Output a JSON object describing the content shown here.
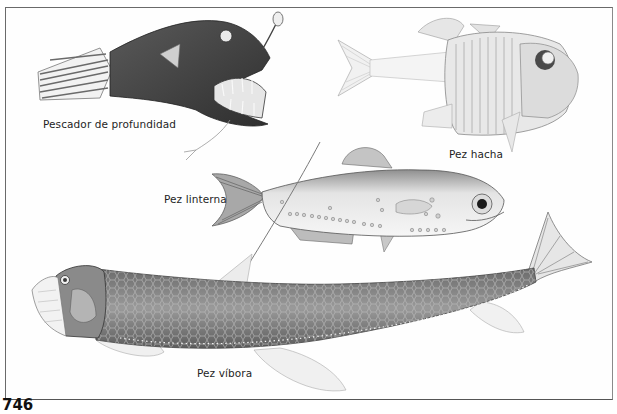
{
  "page": {
    "number": "746",
    "background": "#ffffff",
    "frame_color": "#6a6a6a"
  },
  "illustrations": [
    {
      "id": "anglerfish",
      "label": "Pescador de profundidad",
      "tone": "#4a4a4a"
    },
    {
      "id": "hatchetfish",
      "label": "Pez hacha",
      "tone": "#bdbdbd"
    },
    {
      "id": "lanternfish",
      "label": "Pez linterna",
      "tone": "#9a9a9a"
    },
    {
      "id": "viperfish",
      "label": "Pez víbora",
      "tone": "#7d7d7d"
    }
  ]
}
